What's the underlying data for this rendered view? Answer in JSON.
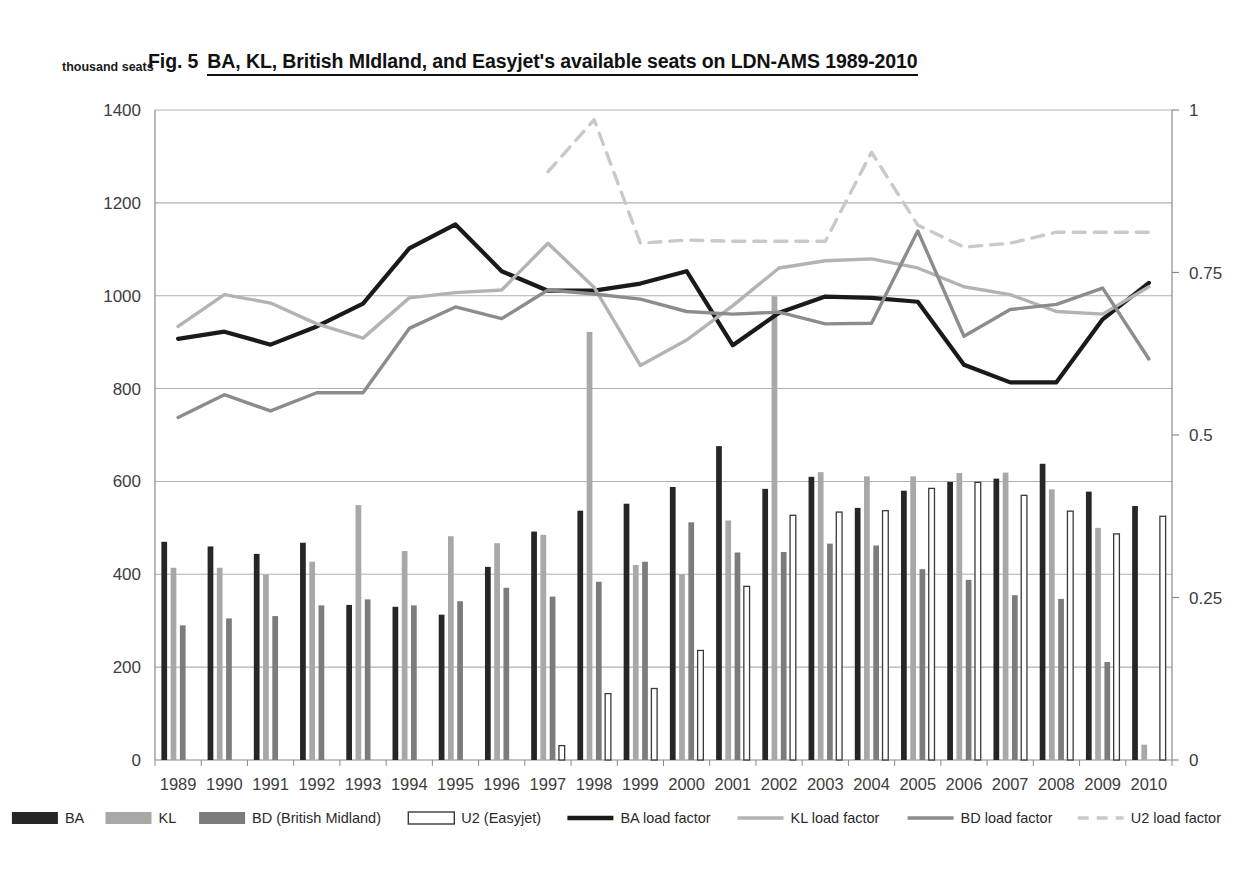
{
  "figure": {
    "label_prefix": "Fig. 5",
    "title": "BA, KL, British MIdland, and Easyjet's available seats on LDN-AMS 1989-2010",
    "y_axis_unit_label": "thousand seats"
  },
  "colors": {
    "ba": "#262626",
    "kl": "#a8a8a8",
    "bd": "#7c7c7c",
    "u2_fill": "#ffffff",
    "u2_stroke": "#3a3a3a",
    "ba_line": "#1a1a1a",
    "kl_line": "#b3b3b3",
    "bd_line": "#8c8c8c",
    "u2_line": "#c9c9c9",
    "grid": "#b0b0b0",
    "axis": "#8a8a8a"
  },
  "chart_data": {
    "type": "bar",
    "xlabel": "",
    "ylabel": "thousand seats",
    "ylim": [
      0,
      1400
    ],
    "y2lim": [
      0,
      1
    ],
    "grid": true,
    "legend_position": "bottom",
    "categories": [
      "1989",
      "1990",
      "1991",
      "1992",
      "1993",
      "1994",
      "1995",
      "1996",
      "1997",
      "1998",
      "1999",
      "2000",
      "2001",
      "2002",
      "2003",
      "2004",
      "2005",
      "2006",
      "2007",
      "2008",
      "2009",
      "2010"
    ],
    "y_ticks": [
      0,
      200,
      400,
      600,
      800,
      1000,
      1200,
      1400
    ],
    "y2_ticks": [
      0,
      0.25,
      0.5,
      0.75,
      1
    ],
    "x_ticks": [
      "1989",
      "1990",
      "1991",
      "1992",
      "1993",
      "1994",
      "1995",
      "1996",
      "1997",
      "1998",
      "1999",
      "2000",
      "2001",
      "2002",
      "2003",
      "2004",
      "2005",
      "2006",
      "2007",
      "2008",
      "2009",
      "2010"
    ],
    "series": [
      {
        "name": "BA",
        "kind": "bar",
        "axis": "left",
        "values": [
          470,
          460,
          444,
          468,
          334,
          330,
          313,
          416,
          492,
          537,
          552,
          588,
          676,
          584,
          610,
          543,
          580,
          599,
          606,
          638,
          578,
          547
        ]
      },
      {
        "name": "KL",
        "kind": "bar",
        "axis": "left",
        "values": [
          414,
          414,
          399,
          427,
          549,
          450,
          482,
          467,
          485,
          922,
          420,
          400,
          516,
          999,
          620,
          611,
          611,
          618,
          619,
          583,
          500,
          33
        ]
      },
      {
        "name": "BD (British Midland)",
        "kind": "bar",
        "axis": "left",
        "values": [
          290,
          305,
          310,
          333,
          346,
          333,
          342,
          371,
          352,
          384,
          427,
          512,
          447,
          448,
          466,
          462,
          411,
          388,
          355,
          347,
          211,
          0
        ]
      },
      {
        "name": "U2 (Easyjet)",
        "kind": "bar",
        "axis": "left",
        "values": [
          0,
          0,
          0,
          0,
          0,
          0,
          0,
          0,
          31,
          143,
          154,
          236,
          374,
          527,
          534,
          537,
          585,
          598,
          570,
          536,
          487,
          525
        ]
      },
      {
        "name": "BA load factor",
        "kind": "line",
        "axis": "right",
        "style": "solid",
        "values": [
          0.648,
          0.659,
          0.639,
          0.667,
          0.702,
          0.787,
          0.824,
          0.752,
          0.722,
          0.722,
          0.733,
          0.752,
          0.638,
          0.688,
          0.713,
          0.711,
          0.705,
          0.608,
          0.581,
          0.581,
          0.678,
          0.734
        ]
      },
      {
        "name": "KL load factor",
        "kind": "line",
        "axis": "right",
        "style": "solid",
        "values": [
          0.667,
          0.716,
          0.703,
          0.671,
          0.649,
          0.711,
          0.719,
          0.723,
          0.795,
          0.727,
          0.607,
          0.646,
          0.699,
          0.757,
          0.768,
          0.771,
          0.757,
          0.728,
          0.716,
          0.69,
          0.686,
          0.728
        ]
      },
      {
        "name": "BD load factor",
        "kind": "line",
        "axis": "right",
        "style": "solid",
        "values": [
          0.527,
          0.562,
          0.537,
          0.565,
          0.565,
          0.664,
          0.697,
          0.679,
          0.723,
          0.717,
          0.709,
          0.69,
          0.686,
          0.689,
          0.671,
          0.672,
          0.814,
          0.652,
          0.693,
          0.701,
          0.726,
          0.617
        ]
      },
      {
        "name": "U2 load factor",
        "kind": "line",
        "axis": "right",
        "style": "dashed",
        "values": [
          null,
          null,
          null,
          null,
          null,
          null,
          null,
          null,
          0.905,
          0.985,
          0.795,
          0.8,
          0.798,
          0.798,
          0.798,
          0.935,
          0.823,
          0.789,
          0.795,
          0.812,
          0.812,
          0.812
        ]
      }
    ]
  },
  "legend": {
    "items": [
      {
        "label": "BA",
        "type": "swatch",
        "color_key": "ba"
      },
      {
        "label": "KL",
        "type": "swatch",
        "color_key": "kl"
      },
      {
        "label": "BD (British Midland)",
        "type": "swatch",
        "color_key": "bd"
      },
      {
        "label": "U2 (Easyjet)",
        "type": "swatch-outline",
        "color_key": "u2_fill"
      },
      {
        "label": "BA load factor",
        "type": "line",
        "color_key": "ba_line"
      },
      {
        "label": "KL load factor",
        "type": "line",
        "color_key": "kl_line"
      },
      {
        "label": "BD load factor",
        "type": "line",
        "color_key": "bd_line"
      },
      {
        "label": "U2 load factor",
        "type": "line-dashed",
        "color_key": "u2_line"
      }
    ]
  }
}
